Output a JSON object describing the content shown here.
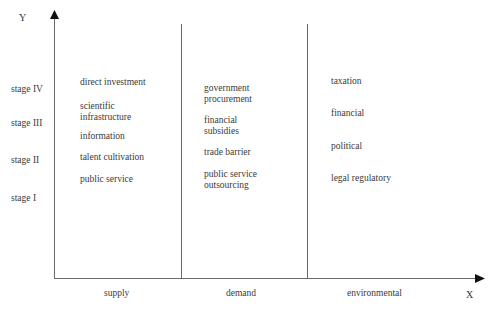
{
  "axes": {
    "y_label": "Y",
    "x_label": "X"
  },
  "stages": [
    "stage IV",
    "stage III",
    "stage II",
    "stage I"
  ],
  "columns": [
    {
      "label": "supply",
      "items": [
        "direct investment",
        "scientific infrastructure",
        "information",
        "talent cultivation",
        "public service"
      ]
    },
    {
      "label": "demand",
      "items": [
        "government procurement",
        "financial subsidies",
        "trade barrier",
        "public service outsourcing"
      ]
    },
    {
      "label": "environmental",
      "items": [
        "taxation",
        "financial",
        "political",
        "legal regulatory"
      ]
    }
  ],
  "colors": {
    "line": "#6a6a6a",
    "text": "#3a3a3a"
  }
}
